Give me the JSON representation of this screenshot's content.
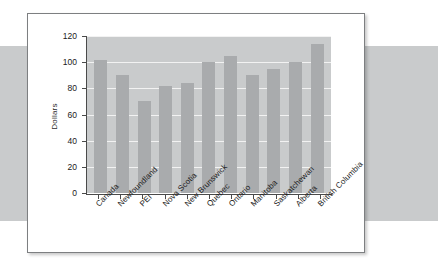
{
  "chart_data": {
    "type": "bar",
    "title": "",
    "xlabel": "",
    "ylabel": "Dollars",
    "categories": [
      "Canada",
      "Newfoundland",
      "PEI",
      "Nova Scotia",
      "New Brunswick",
      "Quebec",
      "Ontario",
      "Manitoba",
      "Saskatchewan",
      "Alberta",
      "British Columbia"
    ],
    "values": [
      102,
      90,
      70,
      82,
      84,
      100,
      105,
      90,
      95,
      100,
      114
    ],
    "ylim": [
      0,
      120
    ],
    "yticks": [
      0,
      20,
      40,
      60,
      80,
      100,
      120
    ],
    "ytick_labels": [
      "0",
      "20",
      "40",
      "60",
      "80",
      "100",
      "120"
    ],
    "grid": true,
    "legend": false,
    "bar_color": "#a9abad",
    "plot_background": "#c9cbcc",
    "gridline_color": "#f2f2f2"
  },
  "page": {
    "background_band_color": "#c9cbcc",
    "card_background": "#ffffff",
    "card_border_color": "#7d7f81"
  }
}
